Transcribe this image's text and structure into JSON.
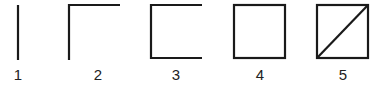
{
  "figures": [
    {
      "label": "1",
      "description": "single vertical line"
    },
    {
      "label": "2",
      "description": "two sides: left and top"
    },
    {
      "label": "3",
      "description": "three sides: left, top, bottom"
    },
    {
      "label": "4",
      "description": "closed square"
    },
    {
      "label": "5",
      "description": "square with diagonal"
    }
  ],
  "colors": {
    "stroke": "#1a1a1a",
    "background": "#ffffff"
  }
}
